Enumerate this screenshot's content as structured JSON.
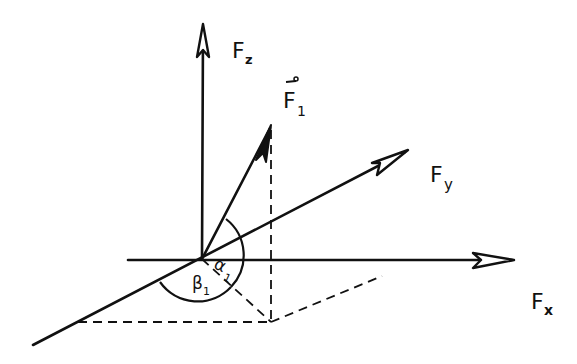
{
  "diagram": {
    "type": "3d-force-decomposition",
    "axes": {
      "x": {
        "label": "F",
        "subscript": "x"
      },
      "y": {
        "label": "F",
        "subscript": "y"
      },
      "z": {
        "label": "F",
        "subscript": "z"
      }
    },
    "vector": {
      "label": "F",
      "subscript": "1",
      "overarrow": true
    },
    "angles": [
      {
        "symbol": "α",
        "subscript": "1"
      },
      {
        "symbol": "β",
        "subscript": "1"
      }
    ],
    "colors": {
      "ink": "#111111",
      "background": "#ffffff"
    }
  }
}
